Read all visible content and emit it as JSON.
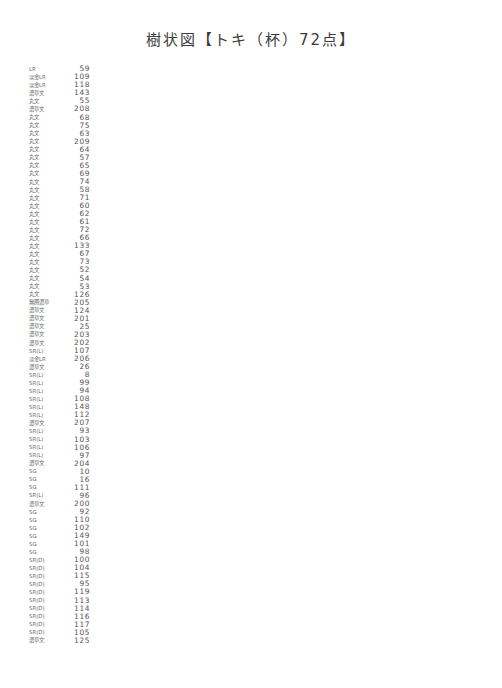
{
  "title": "樹状図【トキ（杯）72点】",
  "axis": {
    "xlabel": "",
    "ticks": [
      "0.0",
      "0.5",
      "1.0",
      "1.5",
      "2.0",
      "2.5",
      "3.0",
      "3.5"
    ],
    "xmin": 0.0,
    "xmax": 3.5,
    "cut_lines": [
      0.7,
      1.5,
      3.0
    ]
  },
  "colors": {
    "line": "#8a8a8a",
    "text": "#4a4a4a",
    "cutline": "#333333",
    "background": "#ffffff"
  },
  "cluster_labels": [
    {
      "name": "A1",
      "x": 1.52,
      "y": 88,
      "size": "big"
    },
    {
      "name": "A2",
      "x": 1.52,
      "y": 181,
      "size": "big"
    },
    {
      "name": "A3",
      "x": 1.52,
      "y": 285,
      "size": "big"
    },
    {
      "name": "A4",
      "x": 1.52,
      "y": 309,
      "size": "big"
    },
    {
      "name": "A",
      "x": 3.04,
      "y": 227,
      "size": "big"
    },
    {
      "name": "B1a",
      "x": 0.74,
      "y": 343,
      "size": "small"
    },
    {
      "name": "B1b",
      "x": 0.74,
      "y": 460,
      "size": "small"
    },
    {
      "name": "B1c",
      "x": 0.74,
      "y": 478,
      "size": "small"
    },
    {
      "name": "B1d",
      "x": 0.74,
      "y": 503,
      "size": "small"
    },
    {
      "name": "B1e",
      "x": 0.74,
      "y": 526,
      "size": "small"
    },
    {
      "name": "B1f",
      "x": 0.74,
      "y": 551,
      "size": "small"
    },
    {
      "name": "B1",
      "x": 1.52,
      "y": 518,
      "size": "mid"
    },
    {
      "name": "B2",
      "x": 0.74,
      "y": 623,
      "size": "mid"
    },
    {
      "name": "B",
      "x": 3.04,
      "y": 566,
      "size": "big"
    },
    {
      "name": "C",
      "x": 3.04,
      "y": 654,
      "size": "big"
    }
  ],
  "chart_data": {
    "type": "dendrogram",
    "title": "樹状図【トキ（杯）72点】",
    "xlabel": "",
    "ylabel": "",
    "xlim": [
      0.0,
      3.5
    ],
    "x_ticks": [
      0.0,
      0.5,
      1.0,
      1.5,
      2.0,
      2.5,
      3.0,
      3.5
    ],
    "grid": false,
    "orientation": "horizontal",
    "n_leaves": 72,
    "cut_lines": [
      0.7,
      1.5,
      3.0
    ],
    "clusters": [
      "A1",
      "A2",
      "A3",
      "A4",
      "A",
      "B1a",
      "B1b",
      "B1c",
      "B1d",
      "B1e",
      "B1f",
      "B1",
      "B2",
      "B",
      "C"
    ],
    "leaves": [
      {
        "label": "LR",
        "id": "59"
      },
      {
        "label": "淡金LR",
        "id": "109"
      },
      {
        "label": "淡金LR",
        "id": "118"
      },
      {
        "label": "濃草文",
        "id": "143"
      },
      {
        "label": "丸文",
        "id": "55"
      },
      {
        "label": "濃草文",
        "id": "208"
      },
      {
        "label": "丸文",
        "id": "68"
      },
      {
        "label": "丸文",
        "id": "75"
      },
      {
        "label": "丸文",
        "id": "63"
      },
      {
        "label": "丸文",
        "id": "209"
      },
      {
        "label": "丸文",
        "id": "64"
      },
      {
        "label": "丸文",
        "id": "57"
      },
      {
        "label": "丸文",
        "id": "65"
      },
      {
        "label": "丸文",
        "id": "69"
      },
      {
        "label": "丸文",
        "id": "74"
      },
      {
        "label": "丸文",
        "id": "58"
      },
      {
        "label": "丸文",
        "id": "71"
      },
      {
        "label": "丸文",
        "id": "60"
      },
      {
        "label": "丸文",
        "id": "62"
      },
      {
        "label": "丸文",
        "id": "61"
      },
      {
        "label": "丸文",
        "id": "72"
      },
      {
        "label": "丸文",
        "id": "66"
      },
      {
        "label": "丸文",
        "id": "133"
      },
      {
        "label": "丸文",
        "id": "67"
      },
      {
        "label": "丸文",
        "id": "73"
      },
      {
        "label": "丸文",
        "id": "52"
      },
      {
        "label": "丸文",
        "id": "54"
      },
      {
        "label": "丸文",
        "id": "53"
      },
      {
        "label": "丸文",
        "id": "126"
      },
      {
        "label": "無圏濃草",
        "id": "205"
      },
      {
        "label": "濃草文",
        "id": "124"
      },
      {
        "label": "濃草文",
        "id": "201"
      },
      {
        "label": "濃草文",
        "id": "25"
      },
      {
        "label": "濃草文",
        "id": "203"
      },
      {
        "label": "濃草文",
        "id": "202"
      },
      {
        "label": "SR(L)",
        "id": "107"
      },
      {
        "label": "淡金LR",
        "id": "206"
      },
      {
        "label": "濃草文",
        "id": "26"
      },
      {
        "label": "SR(L)",
        "id": "8"
      },
      {
        "label": "SR(L)",
        "id": "99"
      },
      {
        "label": "SR(L)",
        "id": "94"
      },
      {
        "label": "SR(L)",
        "id": "108"
      },
      {
        "label": "SR(L)",
        "id": "148"
      },
      {
        "label": "SR(L)",
        "id": "112"
      },
      {
        "label": "濃草文",
        "id": "207"
      },
      {
        "label": "SR(L)",
        "id": "93"
      },
      {
        "label": "SR(L)",
        "id": "103"
      },
      {
        "label": "SR(L)",
        "id": "106"
      },
      {
        "label": "SR(L)",
        "id": "97"
      },
      {
        "label": "濃草文",
        "id": "204"
      },
      {
        "label": "SG",
        "id": "10"
      },
      {
        "label": "SG",
        "id": "16"
      },
      {
        "label": "SG",
        "id": "111"
      },
      {
        "label": "SR(L)",
        "id": "96"
      },
      {
        "label": "濃草文",
        "id": "200"
      },
      {
        "label": "SG",
        "id": "92"
      },
      {
        "label": "SG",
        "id": "110"
      },
      {
        "label": "SG",
        "id": "102"
      },
      {
        "label": "SG",
        "id": "149"
      },
      {
        "label": "SG",
        "id": "101"
      },
      {
        "label": "SG",
        "id": "98"
      },
      {
        "label": "SR(D)",
        "id": "100"
      },
      {
        "label": "SR(D)",
        "id": "104"
      },
      {
        "label": "SR(D)",
        "id": "115"
      },
      {
        "label": "SR(D)",
        "id": "95"
      },
      {
        "label": "SR(D)",
        "id": "119"
      },
      {
        "label": "SR(D)",
        "id": "113"
      },
      {
        "label": "SR(D)",
        "id": "114"
      },
      {
        "label": "SR(D)",
        "id": "116"
      },
      {
        "label": "SR(D)",
        "id": "117"
      },
      {
        "label": "SR(D)",
        "id": "105"
      },
      {
        "label": "濃草文",
        "id": "125"
      }
    ],
    "merges": [
      {
        "children": [
          0,
          1
        ],
        "height": 0.29
      },
      {
        "children": [
          2,
          "m0"
        ],
        "height": 0.6
      },
      {
        "children": [
          3,
          4
        ],
        "height": 0.42
      },
      {
        "children": [
          5,
          6
        ],
        "height": 0.22
      },
      {
        "children": [
          7,
          8
        ],
        "height": 0.3
      },
      {
        "children": [
          9,
          10
        ],
        "height": 0.22
      },
      {
        "children": [
          "m4",
          "m5"
        ],
        "height": 0.36
      },
      {
        "children": [
          "m3",
          "m6"
        ],
        "height": 0.44
      },
      {
        "children": [
          11,
          12
        ],
        "height": 0.28
      },
      {
        "children": [
          13,
          14
        ],
        "height": 0.2
      },
      {
        "children": [
          "m8",
          "m9"
        ],
        "height": 0.33
      },
      {
        "children": [
          "m7",
          "m10"
        ],
        "height": 0.5
      },
      {
        "children": [
          15,
          16
        ],
        "height": 0.25
      },
      {
        "children": [
          "m11",
          "m12"
        ],
        "height": 0.58
      },
      {
        "children": [
          "m2",
          "m13"
        ],
        "height": 0.67
      },
      {
        "children": [
          17,
          18
        ],
        "height": 0.4
      },
      {
        "children": [
          19,
          20
        ],
        "height": 0.22
      },
      {
        "children": [
          21,
          22
        ],
        "height": 0.14
      },
      {
        "children": [
          23,
          24
        ],
        "height": 0.18
      },
      {
        "children": [
          "m17",
          "m18"
        ],
        "height": 0.26
      },
      {
        "children": [
          "m16",
          "m19"
        ],
        "height": 0.32
      },
      {
        "children": [
          "m15",
          "m20"
        ],
        "height": 0.48
      },
      {
        "children": [
          "m14",
          "m21"
        ],
        "height": 0.82
      },
      {
        "children": [
          25,
          26
        ],
        "height": 0.26
      },
      {
        "children": [
          "m23",
          27
        ],
        "height": 0.36
      },
      {
        "children": [
          "m22",
          "m24"
        ],
        "height": 1.9
      },
      {
        "children": [
          28,
          29
        ],
        "height": 0.52
      },
      {
        "children": [
          30,
          31
        ],
        "height": 0.24
      },
      {
        "children": [
          32,
          33
        ],
        "height": 0.2
      },
      {
        "children": [
          "m28",
          34
        ],
        "height": 0.34
      },
      {
        "children": [
          "m27",
          "m29"
        ],
        "height": 0.46
      },
      {
        "children": [
          "m26",
          "m30"
        ],
        "height": 0.7
      },
      {
        "children": [
          35,
          36
        ],
        "height": 0.25
      },
      {
        "children": [
          37,
          38
        ],
        "height": 0.18
      },
      {
        "children": [
          39,
          40
        ],
        "height": 0.22
      },
      {
        "children": [
          41,
          42
        ],
        "height": 0.16
      },
      {
        "children": [
          "m34",
          "m35"
        ],
        "height": 0.3
      },
      {
        "children": [
          "m33",
          "m36"
        ],
        "height": 0.4
      },
      {
        "children": [
          "m32",
          "m37"
        ],
        "height": 0.52
      },
      {
        "children": [
          43,
          44
        ],
        "height": 0.22
      },
      {
        "children": [
          45,
          46
        ],
        "height": 0.17
      },
      {
        "children": [
          47,
          48
        ],
        "height": 0.2
      },
      {
        "children": [
          "m41",
          "m42"
        ],
        "height": 0.3
      },
      {
        "children": [
          "m40",
          "m43"
        ],
        "height": 0.44
      },
      {
        "children": [
          "m39",
          "m44"
        ],
        "height": 0.64
      },
      {
        "children": [
          "m31",
          "m45"
        ],
        "height": 0.92
      },
      {
        "children": [
          49,
          50
        ],
        "height": 0.28
      },
      {
        "children": [
          51,
          52
        ],
        "height": 0.3
      },
      {
        "children": [
          "m47",
          "m48"
        ],
        "height": 0.5
      },
      {
        "children": [
          53,
          54
        ],
        "height": 0.26
      },
      {
        "children": [
          "m49",
          "m50"
        ],
        "height": 0.66
      },
      {
        "children": [
          "m46",
          "m51"
        ],
        "height": 1.1
      },
      {
        "children": [
          55,
          56
        ],
        "height": 0.24
      },
      {
        "children": [
          57,
          58
        ],
        "height": 0.22
      },
      {
        "children": [
          59,
          60
        ],
        "height": 0.18
      },
      {
        "children": [
          "m54",
          "m55"
        ],
        "height": 0.34
      },
      {
        "children": [
          "m53",
          "m56"
        ],
        "height": 0.52
      },
      {
        "children": [
          "m52",
          "m57"
        ],
        "height": 1.45
      },
      {
        "children": [
          61,
          62
        ],
        "height": 0.36
      },
      {
        "children": [
          63,
          64
        ],
        "height": 0.2
      },
      {
        "children": [
          65,
          66
        ],
        "height": 0.28
      },
      {
        "children": [
          67,
          68
        ],
        "height": 0.22
      },
      {
        "children": [
          "m61",
          "m62"
        ],
        "height": 0.4
      },
      {
        "children": [
          69,
          70
        ],
        "height": 0.18
      },
      {
        "children": [
          "m60",
          "m64"
        ],
        "height": 0.5
      },
      {
        "children": [
          "m59",
          "m63"
        ],
        "height": 0.62
      },
      {
        "children": [
          "m65",
          "m66"
        ],
        "height": 0.92
      },
      {
        "children": [
          "m58",
          "m67"
        ],
        "height": 2.05
      },
      {
        "children": [
          71,
          "m68"
        ],
        "height": 3.2
      },
      {
        "children": [
          "m25",
          "m69"
        ],
        "height": 3.38
      }
    ]
  }
}
